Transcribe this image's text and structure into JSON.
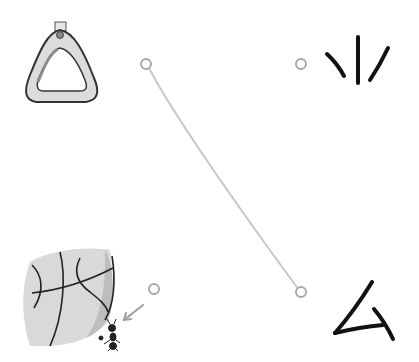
{
  "puzzle": {
    "type": "match-pictures-to-symbols",
    "left_items": [
      {
        "id": "stirrup",
        "name": "triangle-handle-ring",
        "dot": {
          "x": 146,
          "y": 64
        }
      },
      {
        "id": "ball",
        "name": "big-ball-with-ant",
        "dot": {
          "x": 154,
          "y": 289
        }
      }
    ],
    "right_items": [
      {
        "id": "sym-rays",
        "name": "three-strokes-symbol",
        "dot": {
          "x": 301,
          "y": 64
        }
      },
      {
        "id": "sym-triangle",
        "name": "open-triangle-symbol",
        "dot": {
          "x": 301,
          "y": 292
        }
      }
    ],
    "connections": [
      {
        "from": "stirrup",
        "to": "sym-triangle",
        "color": "#c8c8c8"
      }
    ],
    "colors": {
      "dot_stroke": "#a8a8a8",
      "line": "#c8c8c8",
      "ink": "#111111",
      "ball_fill": "#d9d9d9",
      "ball_shade": "#bdbdbd",
      "arrow": "#a0a0a0"
    }
  }
}
